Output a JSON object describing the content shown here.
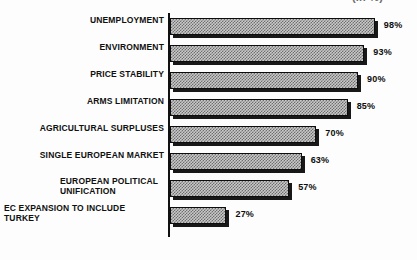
{
  "header": {
    "clipped_note": "(in %)"
  },
  "chart_data": {
    "type": "bar",
    "orientation": "horizontal",
    "title": "",
    "subtitle": "",
    "xlabel": "",
    "ylabel": "",
    "xlim": [
      0,
      100
    ],
    "grid": false,
    "legend": false,
    "value_suffix": "%",
    "categories": [
      "UNEMPLOYMENT",
      "ENVIRONMENT",
      "PRICE STABILITY",
      "ARMS LIMITATION",
      "AGRICULTURAL SURPLUSES",
      "SINGLE EUROPEAN MARKET",
      "EUROPEAN POLITICAL\nUNIFICATION",
      "EC EXPANSION TO INCLUDE\nTURKEY"
    ],
    "values": [
      98,
      93,
      90,
      85,
      70,
      63,
      57,
      27
    ],
    "value_labels": [
      "98%",
      "93%",
      "90%",
      "85%",
      "70%",
      "63%",
      "57%",
      "27%"
    ],
    "bar_fill": "#8a8a8a",
    "bar_outline": "#0d0d0d",
    "shadow_color": "#181818",
    "background": "#fdfdfd"
  }
}
